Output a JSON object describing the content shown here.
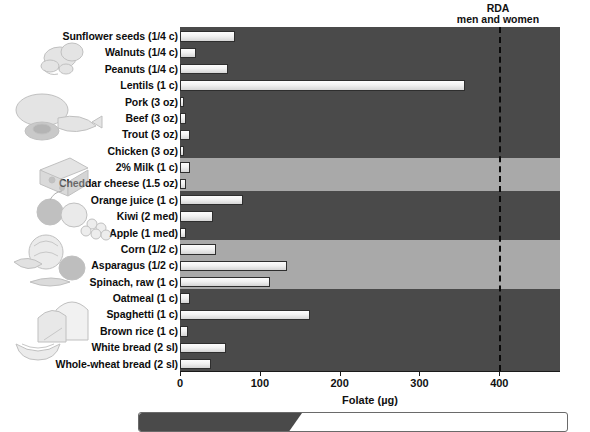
{
  "chart_data": {
    "type": "bar",
    "orientation": "horizontal",
    "title": "",
    "xlabel": "Folate (µg)",
    "ylabel": "",
    "xlim": [
      0,
      476
    ],
    "xticks": [
      0,
      100,
      200,
      300,
      400
    ],
    "grid": false,
    "legend": "none",
    "categories": [
      "Sunflower seeds (1/4 c)",
      "Walnuts (1/4 c)",
      "Peanuts (1/4 c)",
      "Lentils (1 c)",
      "Pork (3 oz)",
      "Beef (3 oz)",
      "Trout (3 oz)",
      "Chicken (3 oz)",
      "2% Milk (1 c)",
      "Cheddar cheese (1.5 oz)",
      "Orange juice (1 c)",
      "Kiwi (2 med)",
      "Apple (1 med)",
      "Corn (1/2 c)",
      "Asparagus (1/2 c)",
      "Spinach, raw (1 c)",
      "Oatmeal (1 c)",
      "Spaghetti (1 c)",
      "Brown rice (1 c)",
      "White bread (2 sl)",
      "Whole-wheat bread (2 sl)"
    ],
    "values": [
      69,
      20,
      60,
      357,
      5,
      8,
      12,
      5,
      12,
      8,
      79,
      41,
      7,
      45,
      134,
      113,
      13,
      163,
      10,
      58,
      39
    ],
    "annotations": [
      {
        "name": "rda-reference-line",
        "line1": "RDA",
        "line2": "men and women",
        "value": 400,
        "style": "dashed-vertical"
      }
    ],
    "band_groups": [
      {
        "label": "nuts-and-seeds",
        "rows": [
          0,
          1,
          2,
          3
        ],
        "shade": "dark"
      },
      {
        "label": "meat-fish-poultry",
        "rows": [
          4,
          5,
          6,
          7
        ],
        "shade": "dark"
      },
      {
        "label": "dairy",
        "rows": [
          8,
          9
        ],
        "shade": "light"
      },
      {
        "label": "fruit",
        "rows": [
          10,
          11,
          12
        ],
        "shade": "dark"
      },
      {
        "label": "vegetables",
        "rows": [
          13,
          14,
          15
        ],
        "shade": "light"
      },
      {
        "label": "grains",
        "rows": [
          16,
          17,
          18,
          19,
          20
        ],
        "shade": "dark"
      }
    ]
  },
  "axis": {
    "tick_labels": [
      "0",
      "100",
      "200",
      "300",
      "400"
    ],
    "x_title": "Folate (µg)"
  },
  "rda": {
    "line1": "RDA",
    "line2": "men and women"
  },
  "colors": {
    "band_dark": "#4a4a4a",
    "band_light": "#a9a9a9",
    "bar_fill": "#f2f2f2",
    "bar_outline": "#2e2e2e",
    "text": "#111111",
    "rda_line": "#0a0a0a"
  },
  "illustrations": [
    {
      "name": "nuts-and-seeds-illustration"
    },
    {
      "name": "meat-fish-poultry-illustration"
    },
    {
      "name": "cheese-and-milk-illustration"
    },
    {
      "name": "fruit-illustration"
    },
    {
      "name": "vegetables-illustration"
    },
    {
      "name": "bread-and-cereal-illustration"
    }
  ],
  "banner": {
    "tab_text": ""
  }
}
